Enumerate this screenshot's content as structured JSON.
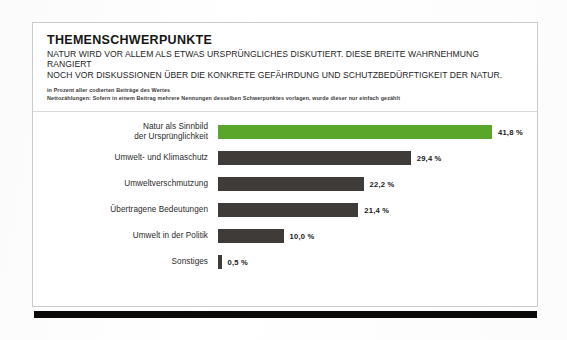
{
  "card": {
    "title": "THEMENSCHWERPUNKTE",
    "subtitle_line1": "NATUR WIRD VOR ALLEM ALS ETWAS URSPRÜNGLICHES DISKUTIERT. DIESE BREITE WAHRNEHMUNG RANGIERT",
    "subtitle_line2": "NOCH VOR DISKUSSIONEN ÜBER DIE KONKRETE GEFÄHRDUNG UND SCHUTZBEDÜRFTIGKEIT DER NATUR.",
    "note_line1": "in Prozent aller codierten Beiträge des Wertes",
    "note_line2": "Nettozählungen: Sofern in einem Beitrag mehrere Nennungen desselben Schwerpunktes vorlagen, wurde dieser nur einfach gezählt"
  },
  "colors": {
    "accent": "#5aa62b",
    "bar": "#3e3b39",
    "footer_bar": "#0b0a09",
    "card_border": "#c9cacb"
  },
  "chart_data": {
    "type": "bar",
    "orientation": "horizontal",
    "title": "THEMENSCHWERPUNKTE",
    "xlabel": "",
    "ylabel": "",
    "xlim": [
      0,
      45
    ],
    "grid": false,
    "legend": false,
    "value_suffix": "%",
    "decimal_separator": ",",
    "categories": [
      "Natur als Sinnbild der Ursprünglichkeit",
      "Umwelt- und Klimaschutz",
      "Umweltverschmutzung",
      "Übertragene Bedeutungen",
      "Umwelt in der Politik",
      "Sonstiges"
    ],
    "values": [
      41.8,
      29.4,
      22.2,
      21.4,
      10.0,
      0.5
    ],
    "value_labels": [
      "41,8 %",
      "29,4 %",
      "22,2 %",
      "21,4 %",
      "10,0 %",
      "0,5 %"
    ],
    "highlight_index": 0
  },
  "rows": [
    {
      "label_line1": "Natur als Sinnbild",
      "label_line2": "der Ursprünglichkeit",
      "value_label": "41,8 %",
      "value": 41.8
    },
    {
      "label_line1": "Umwelt- und Klimaschutz",
      "label_line2": "",
      "value_label": "29,4 %",
      "value": 29.4
    },
    {
      "label_line1": "Umweltverschmutzung",
      "label_line2": "",
      "value_label": "22,2 %",
      "value": 22.2
    },
    {
      "label_line1": "Übertragene Bedeutungen",
      "label_line2": "",
      "value_label": "21,4 %",
      "value": 21.4
    },
    {
      "label_line1": "Umwelt in der Politik",
      "label_line2": "",
      "value_label": "10,0 %",
      "value": 10.0
    },
    {
      "label_line1": "Sonstiges",
      "label_line2": "",
      "value_label": "0,5 %",
      "value": 0.5
    }
  ]
}
